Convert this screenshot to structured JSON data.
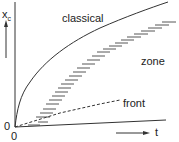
{
  "diagram": {
    "axes": {
      "y_label": "x",
      "y_label_subscript": "c",
      "x_label": "t",
      "origin_x_label": "0",
      "origin_y_label": "0"
    },
    "curves": [
      {
        "name": "classical",
        "label": "classical",
        "style": "solid"
      },
      {
        "name": "zone",
        "label": "zone",
        "style": "hatched"
      },
      {
        "name": "front",
        "label": "front",
        "style": "dashed"
      }
    ]
  }
}
